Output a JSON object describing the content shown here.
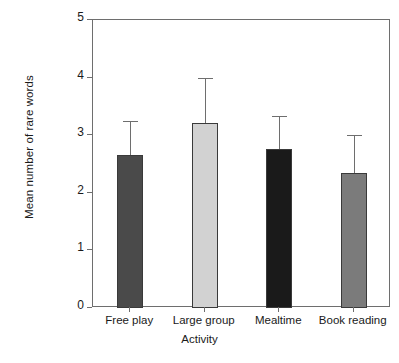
{
  "chart_data": {
    "type": "bar",
    "title": "",
    "xlabel": "Activity",
    "ylabel": "Mean number of rare words",
    "categories": [
      "Free play",
      "Large group",
      "Mealtime",
      "Book reading"
    ],
    "values": [
      2.65,
      3.22,
      2.76,
      2.34
    ],
    "errors": [
      0.6,
      0.78,
      0.57,
      0.66
    ],
    "error_tops": [
      3.25,
      4.0,
      3.33,
      3.0
    ],
    "bar_colors": [
      "#4a4a4a",
      "#d2d2d2",
      "#1a1a1a",
      "#7b7b7b"
    ],
    "bar_edge_color": "#3a3a3a",
    "error_color": "#6e6e6e",
    "axis_color": "#6e6e6e",
    "ylim": [
      0,
      5
    ],
    "yticks": [
      0,
      1,
      2,
      3,
      4,
      5
    ],
    "ytick_labels": [
      "0",
      "1",
      "2",
      "3",
      "4",
      "5"
    ],
    "grid": false,
    "legend": false,
    "legend_position": "none",
    "error_bar_style": "upper-only-with-cap"
  },
  "figure": {
    "background": "#ffffff",
    "frame_border_color": "#6e6e6e"
  }
}
